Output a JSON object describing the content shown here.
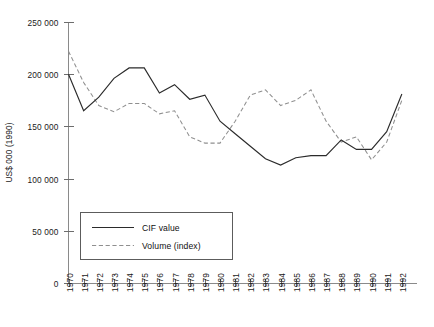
{
  "chart_data": {
    "type": "line",
    "title": "",
    "xlabel": "",
    "ylabel": "US$ 000 (1990)",
    "ylim": [
      0,
      250000
    ],
    "yticks": [
      0,
      50000,
      100000,
      150000,
      200000,
      250000
    ],
    "ytick_labels": [
      "0",
      "50 000",
      "100 000",
      "150 000",
      "200 000",
      "250 000"
    ],
    "grid": false,
    "legend_position": "lower-left-inside",
    "x": [
      1970,
      1971,
      1972,
      1973,
      1974,
      1975,
      1976,
      1977,
      1978,
      1979,
      1980,
      1981,
      1982,
      1983,
      1984,
      1985,
      1986,
      1987,
      1988,
      1989,
      1990,
      1991,
      1992
    ],
    "categories": [
      "1970",
      "1971",
      "1972",
      "1973",
      "1974",
      "1975",
      "1976",
      "1977",
      "1978",
      "1979",
      "1980",
      "1981",
      "1982",
      "1983",
      "1984",
      "1985",
      "1986",
      "1987",
      "1988",
      "1989",
      "1990",
      "1991",
      "1992"
    ],
    "series": [
      {
        "name": "CIF value",
        "style": "solid",
        "color": "#2b2b2b",
        "values": [
          200000,
          165000,
          178000,
          196000,
          206000,
          206000,
          182000,
          190000,
          176000,
          180000,
          155000,
          143000,
          131000,
          119000,
          113000,
          120000,
          122000,
          122000,
          137000,
          128000,
          128000,
          145000,
          181000
        ]
      },
      {
        "name": "Volume (index)",
        "style": "dashed",
        "color": "#8f8f8f",
        "values": [
          222000,
          192000,
          170000,
          164000,
          172000,
          172000,
          162000,
          165000,
          140000,
          134000,
          134000,
          155000,
          180000,
          185000,
          170000,
          175000,
          185000,
          155000,
          135000,
          140000,
          118000,
          135000,
          175000
        ]
      }
    ]
  },
  "legend": {
    "entries": [
      {
        "label": "CIF value"
      },
      {
        "label": "Volume (index)"
      }
    ]
  }
}
